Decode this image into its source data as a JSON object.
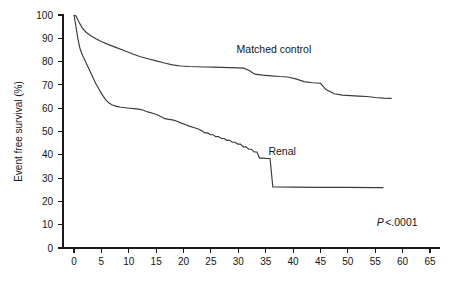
{
  "chart_data": {
    "type": "line",
    "title": "",
    "subtitle": "",
    "xlabel": "",
    "ylabel": "Event free survival (%)",
    "xlim": [
      0,
      65
    ],
    "ylim": [
      0,
      100
    ],
    "grid": false,
    "legend_position": "inline-annotation",
    "x_ticks": [
      0,
      5,
      10,
      15,
      20,
      25,
      30,
      35,
      40,
      45,
      50,
      55,
      60,
      65
    ],
    "x_tick_labels": [
      "0",
      "5",
      "10",
      "15",
      "20",
      "25",
      "30",
      "35",
      "40",
      "45",
      "50",
      "55",
      "60",
      "65"
    ],
    "y_ticks": [
      0,
      10,
      20,
      30,
      40,
      50,
      60,
      70,
      80,
      90,
      100
    ],
    "y_tick_labels": [
      "0",
      "10",
      "20",
      "30",
      "40",
      "50",
      "60",
      "70",
      "80",
      "90",
      "100"
    ],
    "annotations": [
      {
        "name": "matched-control-label",
        "text": "Matched control",
        "x": 36.5,
        "y": 83.5
      },
      {
        "name": "renal-label",
        "text": "Renal",
        "x": 38.0,
        "y": 40.0
      },
      {
        "name": "p-value",
        "text_italic": "P",
        "text_rest": "<.0001",
        "x": 59.0,
        "y": 9.5
      }
    ],
    "series": [
      {
        "name": "Matched control",
        "color": "#3a3a3a",
        "points": [
          [
            0.0,
            100.0
          ],
          [
            0.4,
            99.5
          ],
          [
            0.9,
            97.0
          ],
          [
            1.5,
            94.5
          ],
          [
            2.2,
            92.6
          ],
          [
            3.0,
            91.2
          ],
          [
            4.0,
            89.8
          ],
          [
            5.0,
            88.6
          ],
          [
            6.2,
            87.4
          ],
          [
            7.5,
            86.2
          ],
          [
            9.0,
            84.9
          ],
          [
            10.5,
            83.5
          ],
          [
            12.0,
            82.2
          ],
          [
            13.5,
            81.2
          ],
          [
            15.0,
            80.3
          ],
          [
            16.5,
            79.4
          ],
          [
            18.0,
            78.6
          ],
          [
            19.5,
            78.1
          ],
          [
            21.0,
            77.9
          ],
          [
            22.5,
            77.8
          ],
          [
            24.0,
            77.7
          ],
          [
            25.5,
            77.6
          ],
          [
            27.0,
            77.5
          ],
          [
            28.5,
            77.4
          ],
          [
            30.0,
            77.3
          ],
          [
            31.0,
            77.2
          ],
          [
            32.0,
            76.2
          ],
          [
            33.0,
            74.6
          ],
          [
            34.5,
            74.2
          ],
          [
            36.0,
            73.9
          ],
          [
            37.5,
            73.6
          ],
          [
            39.0,
            73.4
          ],
          [
            40.5,
            72.6
          ],
          [
            42.0,
            71.4
          ],
          [
            43.5,
            70.9
          ],
          [
            45.0,
            70.7
          ],
          [
            46.0,
            68.0
          ],
          [
            47.5,
            66.2
          ],
          [
            49.0,
            65.6
          ],
          [
            50.5,
            65.4
          ],
          [
            52.0,
            65.2
          ],
          [
            53.5,
            65.0
          ],
          [
            55.0,
            64.6
          ],
          [
            56.5,
            64.3
          ],
          [
            58.0,
            64.2
          ]
        ]
      },
      {
        "name": "Renal",
        "color": "#3a3a3a",
        "points": [
          [
            0.0,
            100.0
          ],
          [
            0.3,
            96.0
          ],
          [
            0.7,
            90.0
          ],
          [
            1.1,
            85.5
          ],
          [
            1.6,
            82.5
          ],
          [
            2.2,
            79.5
          ],
          [
            2.8,
            76.5
          ],
          [
            3.4,
            73.5
          ],
          [
            4.0,
            70.5
          ],
          [
            4.6,
            68.0
          ],
          [
            5.2,
            65.6
          ],
          [
            5.8,
            63.6
          ],
          [
            6.4,
            62.2
          ],
          [
            7.0,
            61.4
          ],
          [
            7.8,
            60.8
          ],
          [
            8.6,
            60.4
          ],
          [
            9.4,
            60.2
          ],
          [
            10.2,
            60.0
          ],
          [
            11.0,
            59.8
          ],
          [
            11.8,
            59.6
          ],
          [
            12.6,
            59.2
          ],
          [
            13.2,
            58.6
          ],
          [
            13.8,
            58.2
          ],
          [
            14.5,
            57.7
          ],
          [
            15.2,
            57.2
          ],
          [
            15.9,
            56.3
          ],
          [
            16.6,
            55.5
          ],
          [
            17.3,
            55.2
          ],
          [
            18.0,
            55.0
          ],
          [
            18.8,
            54.4
          ],
          [
            19.6,
            53.6
          ],
          [
            20.4,
            52.9
          ],
          [
            21.2,
            52.2
          ],
          [
            22.0,
            51.6
          ],
          [
            22.8,
            51.0
          ],
          [
            23.4,
            50.2
          ],
          [
            23.9,
            49.4
          ],
          [
            24.4,
            49.4
          ],
          [
            24.9,
            48.6
          ],
          [
            25.4,
            48.6
          ],
          [
            25.9,
            47.8
          ],
          [
            26.4,
            47.8
          ],
          [
            26.9,
            47.0
          ],
          [
            27.4,
            47.0
          ],
          [
            27.9,
            46.2
          ],
          [
            28.4,
            46.2
          ],
          [
            28.9,
            45.4
          ],
          [
            29.4,
            45.4
          ],
          [
            29.9,
            44.6
          ],
          [
            30.4,
            44.6
          ],
          [
            30.9,
            43.4
          ],
          [
            31.4,
            43.4
          ],
          [
            31.9,
            42.4
          ],
          [
            32.4,
            42.4
          ],
          [
            32.9,
            41.2
          ],
          [
            33.4,
            41.2
          ],
          [
            33.9,
            38.6
          ],
          [
            34.6,
            38.6
          ],
          [
            35.2,
            38.4
          ],
          [
            35.8,
            38.4
          ],
          [
            36.3,
            26.2
          ],
          [
            37.0,
            26.2
          ],
          [
            40.0,
            26.1
          ],
          [
            45.0,
            26.0
          ],
          [
            50.0,
            26.0
          ],
          [
            55.0,
            25.9
          ],
          [
            56.5,
            25.9
          ]
        ]
      }
    ]
  },
  "plot_geometry": {
    "left_px": 74,
    "right_px": 430,
    "top_px": 15,
    "bottom_px": 248
  }
}
